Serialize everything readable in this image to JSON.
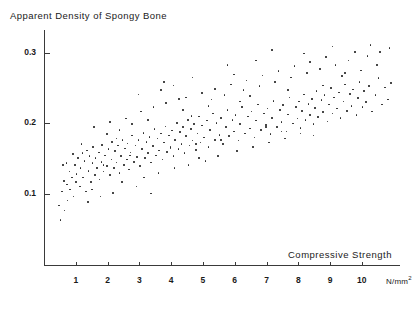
{
  "chart_data": {
    "type": "scatter",
    "title": "Apparent Density of Spongy Bone",
    "xlabel": "Compressive Strength",
    "xunit": "N/mm",
    "xunit_exp": "2",
    "ylabel": "",
    "xlim": [
      0,
      11.2
    ],
    "ylim": [
      0,
      0.332
    ],
    "grid": false,
    "legend": null,
    "xticks": [
      1,
      2,
      3,
      4,
      5,
      6,
      7,
      8,
      9,
      10
    ],
    "yticks": [
      0.1,
      0.2,
      0.3
    ],
    "point_color": "#222222",
    "axis_color": "#3a3a3a",
    "points": [
      [
        0.45,
        0.085
      ],
      [
        0.5,
        0.065
      ],
      [
        0.55,
        0.105
      ],
      [
        0.6,
        0.12
      ],
      [
        0.62,
        0.078
      ],
      [
        0.7,
        0.115
      ],
      [
        0.72,
        0.092
      ],
      [
        0.78,
        0.133
      ],
      [
        0.8,
        0.108
      ],
      [
        0.85,
        0.125
      ],
      [
        0.9,
        0.098
      ],
      [
        0.95,
        0.142
      ],
      [
        0.98,
        0.118
      ],
      [
        1.0,
        0.13
      ],
      [
        1.05,
        0.152
      ],
      [
        1.1,
        0.112
      ],
      [
        1.12,
        0.138
      ],
      [
        1.18,
        0.159
      ],
      [
        1.2,
        0.125
      ],
      [
        1.25,
        0.148
      ],
      [
        1.3,
        0.105
      ],
      [
        1.32,
        0.163
      ],
      [
        1.38,
        0.134
      ],
      [
        1.4,
        0.155
      ],
      [
        1.45,
        0.118
      ],
      [
        1.5,
        0.145
      ],
      [
        1.52,
        0.168
      ],
      [
        1.58,
        0.128
      ],
      [
        1.6,
        0.152
      ],
      [
        1.65,
        0.138
      ],
      [
        1.7,
        0.16
      ],
      [
        1.72,
        0.122
      ],
      [
        1.78,
        0.147
      ],
      [
        1.8,
        0.171
      ],
      [
        1.85,
        0.133
      ],
      [
        1.9,
        0.156
      ],
      [
        1.95,
        0.141
      ],
      [
        2.0,
        0.165
      ],
      [
        2.05,
        0.128
      ],
      [
        2.1,
        0.15
      ],
      [
        2.12,
        0.175
      ],
      [
        2.18,
        0.138
      ],
      [
        2.2,
        0.162
      ],
      [
        2.25,
        0.146
      ],
      [
        2.3,
        0.17
      ],
      [
        2.35,
        0.131
      ],
      [
        2.4,
        0.155
      ],
      [
        2.45,
        0.178
      ],
      [
        2.5,
        0.142
      ],
      [
        2.52,
        0.166
      ],
      [
        2.58,
        0.15
      ],
      [
        2.6,
        0.173
      ],
      [
        2.65,
        0.136
      ],
      [
        2.7,
        0.16
      ],
      [
        2.75,
        0.184
      ],
      [
        2.8,
        0.147
      ],
      [
        2.85,
        0.17
      ],
      [
        2.9,
        0.154
      ],
      [
        2.95,
        0.178
      ],
      [
        3.0,
        0.141
      ],
      [
        3.05,
        0.165
      ],
      [
        3.1,
        0.188
      ],
      [
        3.15,
        0.152
      ],
      [
        3.2,
        0.175
      ],
      [
        3.25,
        0.159
      ],
      [
        3.3,
        0.182
      ],
      [
        3.35,
        0.146
      ],
      [
        3.4,
        0.169
      ],
      [
        3.45,
        0.193
      ],
      [
        3.5,
        0.156
      ],
      [
        3.55,
        0.18
      ],
      [
        3.6,
        0.163
      ],
      [
        3.65,
        0.187
      ],
      [
        3.7,
        0.15
      ],
      [
        3.75,
        0.174
      ],
      [
        3.8,
        0.197
      ],
      [
        3.85,
        0.161
      ],
      [
        3.9,
        0.184
      ],
      [
        3.95,
        0.168
      ],
      [
        4.0,
        0.191
      ],
      [
        4.05,
        0.155
      ],
      [
        4.1,
        0.178
      ],
      [
        4.15,
        0.202
      ],
      [
        4.2,
        0.165
      ],
      [
        4.25,
        0.189
      ],
      [
        4.3,
        0.172
      ],
      [
        4.35,
        0.196
      ],
      [
        4.4,
        0.159
      ],
      [
        4.45,
        0.183
      ],
      [
        4.5,
        0.206
      ],
      [
        4.55,
        0.17
      ],
      [
        4.6,
        0.193
      ],
      [
        4.65,
        0.177
      ],
      [
        4.7,
        0.2
      ],
      [
        4.75,
        0.164
      ],
      [
        4.8,
        0.187
      ],
      [
        4.85,
        0.211
      ],
      [
        4.9,
        0.174
      ],
      [
        4.95,
        0.198
      ],
      [
        5.0,
        0.181
      ],
      [
        5.1,
        0.205
      ],
      [
        5.15,
        0.168
      ],
      [
        5.2,
        0.192
      ],
      [
        5.3,
        0.215
      ],
      [
        5.35,
        0.178
      ],
      [
        5.4,
        0.202
      ],
      [
        5.5,
        0.185
      ],
      [
        5.55,
        0.209
      ],
      [
        5.6,
        0.172
      ],
      [
        5.7,
        0.196
      ],
      [
        5.75,
        0.22
      ],
      [
        5.8,
        0.183
      ],
      [
        5.9,
        0.206
      ],
      [
        5.95,
        0.19
      ],
      [
        6.0,
        0.213
      ],
      [
        6.1,
        0.177
      ],
      [
        6.15,
        0.2
      ],
      [
        6.2,
        0.224
      ],
      [
        6.3,
        0.187
      ],
      [
        6.4,
        0.211
      ],
      [
        6.45,
        0.194
      ],
      [
        6.5,
        0.218
      ],
      [
        6.6,
        0.181
      ],
      [
        6.65,
        0.205
      ],
      [
        6.7,
        0.228
      ],
      [
        6.8,
        0.192
      ],
      [
        6.9,
        0.215
      ],
      [
        6.95,
        0.199
      ],
      [
        7.0,
        0.222
      ],
      [
        7.1,
        0.186
      ],
      [
        7.15,
        0.209
      ],
      [
        7.2,
        0.233
      ],
      [
        7.3,
        0.196
      ],
      [
        7.4,
        0.22
      ],
      [
        7.45,
        0.203
      ],
      [
        7.5,
        0.227
      ],
      [
        7.6,
        0.19
      ],
      [
        7.65,
        0.214
      ],
      [
        7.7,
        0.238
      ],
      [
        7.8,
        0.201
      ],
      [
        7.9,
        0.224
      ],
      [
        7.95,
        0.208
      ],
      [
        8.0,
        0.232
      ],
      [
        8.05,
        0.195
      ],
      [
        8.1,
        0.219
      ],
      [
        8.15,
        0.242
      ],
      [
        8.2,
        0.206
      ],
      [
        8.3,
        0.229
      ],
      [
        8.35,
        0.213
      ],
      [
        8.4,
        0.236
      ],
      [
        8.45,
        0.2
      ],
      [
        8.5,
        0.223
      ],
      [
        8.55,
        0.247
      ],
      [
        8.6,
        0.21
      ],
      [
        8.7,
        0.234
      ],
      [
        8.75,
        0.217
      ],
      [
        8.8,
        0.241
      ],
      [
        8.9,
        0.204
      ],
      [
        8.95,
        0.228
      ],
      [
        9.0,
        0.251
      ],
      [
        9.05,
        0.215
      ],
      [
        9.1,
        0.238
      ],
      [
        9.2,
        0.222
      ],
      [
        9.25,
        0.245
      ],
      [
        9.3,
        0.209
      ],
      [
        9.4,
        0.232
      ],
      [
        9.45,
        0.256
      ],
      [
        9.5,
        0.219
      ],
      [
        9.6,
        0.243
      ],
      [
        9.65,
        0.226
      ],
      [
        9.7,
        0.249
      ],
      [
        9.8,
        0.213
      ],
      [
        9.85,
        0.237
      ],
      [
        9.9,
        0.26
      ],
      [
        10.0,
        0.224
      ],
      [
        10.05,
        0.247
      ],
      [
        10.1,
        0.231
      ],
      [
        10.2,
        0.254
      ],
      [
        10.3,
        0.218
      ],
      [
        10.4,
        0.241
      ],
      [
        10.5,
        0.265
      ],
      [
        10.6,
        0.228
      ],
      [
        10.7,
        0.252
      ],
      [
        10.8,
        0.235
      ],
      [
        10.9,
        0.258
      ],
      [
        1.55,
        0.196
      ],
      [
        2.05,
        0.203
      ],
      [
        2.42,
        0.118
      ],
      [
        2.88,
        0.112
      ],
      [
        3.12,
        0.125
      ],
      [
        3.58,
        0.131
      ],
      [
        4.08,
        0.138
      ],
      [
        4.52,
        0.142
      ],
      [
        5.05,
        0.148
      ],
      [
        5.45,
        0.155
      ],
      [
        6.05,
        0.162
      ],
      [
        6.55,
        0.168
      ],
      [
        7.05,
        0.174
      ],
      [
        7.55,
        0.18
      ],
      [
        8.05,
        0.187
      ],
      [
        1.35,
        0.09
      ],
      [
        1.75,
        0.098
      ],
      [
        2.15,
        0.103
      ],
      [
        0.68,
        0.145
      ],
      [
        0.88,
        0.158
      ],
      [
        3.02,
        0.218
      ],
      [
        3.42,
        0.224
      ],
      [
        3.82,
        0.23
      ],
      [
        4.22,
        0.236
      ],
      [
        4.62,
        0.212
      ],
      [
        5.25,
        0.235
      ],
      [
        5.65,
        0.241
      ],
      [
        6.25,
        0.248
      ],
      [
        6.75,
        0.254
      ],
      [
        7.25,
        0.26
      ],
      [
        7.75,
        0.266
      ],
      [
        8.25,
        0.272
      ],
      [
        8.65,
        0.278
      ],
      [
        9.15,
        0.284
      ],
      [
        9.55,
        0.29
      ],
      [
        10.15,
        0.296
      ],
      [
        10.55,
        0.302
      ],
      [
        10.85,
        0.308
      ],
      [
        9.75,
        0.302
      ],
      [
        8.85,
        0.295
      ],
      [
        8.35,
        0.288
      ],
      [
        7.85,
        0.282
      ],
      [
        7.35,
        0.275
      ],
      [
        6.85,
        0.269
      ],
      [
        6.35,
        0.262
      ],
      [
        5.85,
        0.256
      ],
      [
        5.35,
        0.25
      ],
      [
        4.95,
        0.244
      ],
      [
        4.45,
        0.238
      ],
      [
        4.05,
        0.255
      ],
      [
        3.65,
        0.248
      ],
      [
        2.95,
        0.242
      ],
      [
        2.55,
        0.208
      ],
      [
        6.95,
        0.196
      ],
      [
        7.45,
        0.19
      ],
      [
        8.45,
        0.184
      ],
      [
        5.55,
        0.178
      ],
      [
        4.75,
        0.172
      ],
      [
        3.95,
        0.166
      ],
      [
        9.35,
        0.268
      ],
      [
        9.95,
        0.276
      ],
      [
        10.45,
        0.284
      ],
      [
        2.75,
        0.2
      ],
      [
        3.25,
        0.206
      ],
      [
        1.95,
        0.186
      ],
      [
        2.35,
        0.192
      ],
      [
        6.15,
        0.232
      ],
      [
        5.15,
        0.226
      ],
      [
        4.35,
        0.22
      ],
      [
        8.75,
        0.255
      ],
      [
        9.45,
        0.272
      ],
      [
        7.65,
        0.248
      ],
      [
        6.45,
        0.24
      ],
      [
        5.95,
        0.27
      ],
      [
        3.35,
        0.102
      ],
      [
        4.85,
        0.152
      ],
      [
        0.58,
        0.142
      ],
      [
        1.15,
        0.172
      ],
      [
        1.48,
        0.108
      ],
      [
        2.68,
        0.156
      ],
      [
        7.15,
        0.305
      ],
      [
        8.15,
        0.3
      ],
      [
        9.05,
        0.31
      ],
      [
        10.25,
        0.312
      ],
      [
        6.65,
        0.29
      ],
      [
        5.75,
        0.284
      ],
      [
        4.65,
        0.266
      ],
      [
        3.75,
        0.26
      ],
      [
        2.25,
        0.18
      ],
      [
        1.85,
        0.142
      ]
    ]
  }
}
